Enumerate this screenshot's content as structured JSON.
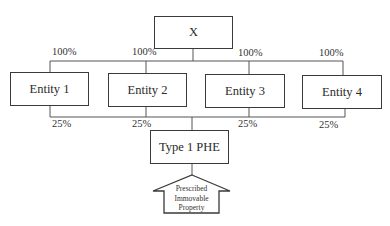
{
  "diagram": {
    "top_node": {
      "label": "X"
    },
    "entities": [
      {
        "label": "Entity 1",
        "ownership_from_top": "100%",
        "ownership_in_phe": "25%"
      },
      {
        "label": "Entity 2",
        "ownership_from_top": "100%",
        "ownership_in_phe": "25%"
      },
      {
        "label": "Entity 3",
        "ownership_from_top": "100%",
        "ownership_in_phe": "25%"
      },
      {
        "label": "Entity 4",
        "ownership_from_top": "100%",
        "ownership_in_phe": "25%"
      }
    ],
    "bottom_node": {
      "label": "Type 1 PHE"
    },
    "arrow": {
      "lines": [
        "Prescribed",
        "Immovable",
        "Property"
      ]
    }
  }
}
